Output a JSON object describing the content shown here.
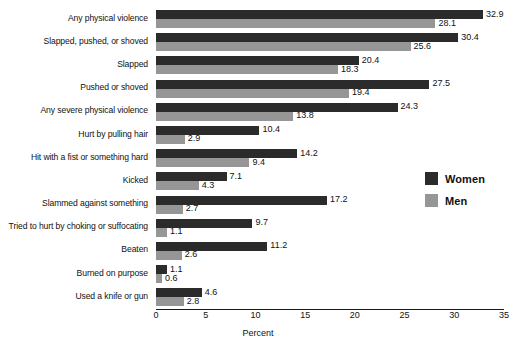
{
  "chart_data": {
    "type": "bar",
    "orientation": "horizontal",
    "title": "",
    "xlabel": "Percent",
    "ylabel": "",
    "xlim": [
      0,
      35
    ],
    "xticks": [
      0,
      5,
      10,
      15,
      20,
      25,
      30,
      35
    ],
    "grid": false,
    "legend_position": "right",
    "categories": [
      "Any physical violence",
      "Slapped, pushed, or shoved",
      "Slapped",
      "Pushed or shoved",
      "Any severe physical violence",
      "Hurt by pulling hair",
      "Hit with a fist or something hard",
      "Kicked",
      "Slammed against something",
      "Tried to hurt by choking or suffocating",
      "Beaten",
      "Burned on purpose",
      "Used a knife or gun"
    ],
    "series": [
      {
        "name": "Women",
        "color": "#2b2b2b",
        "values": [
          32.9,
          30.4,
          20.4,
          27.5,
          24.3,
          10.4,
          14.2,
          7.1,
          17.2,
          9.7,
          11.2,
          1.1,
          4.6
        ],
        "labels": [
          "32.9",
          "30.4",
          "20.4",
          "27.5",
          "24.3",
          "10.4",
          "14.2",
          "7.1",
          "17.2",
          "9.7",
          "11.2",
          "1.1",
          "4.6"
        ]
      },
      {
        "name": "Men",
        "color": "#969696",
        "values": [
          28.1,
          25.6,
          18.3,
          19.4,
          13.8,
          2.9,
          9.4,
          4.3,
          2.7,
          1.1,
          2.6,
          0.6,
          2.8
        ],
        "labels": [
          "28.1",
          "25.6",
          "18.3",
          "19.4",
          "13.8",
          "2.9",
          "9.4",
          "4.3",
          "2.7",
          "1.1",
          "2.6",
          "0.6",
          "2.8"
        ]
      }
    ]
  },
  "legend": {
    "items": [
      {
        "label": "Women",
        "color": "#2b2b2b"
      },
      {
        "label": "Men",
        "color": "#969696"
      }
    ]
  },
  "axis": {
    "title": "Percent",
    "ticks": [
      "0",
      "5",
      "10",
      "15",
      "20",
      "25",
      "30",
      "35"
    ]
  }
}
